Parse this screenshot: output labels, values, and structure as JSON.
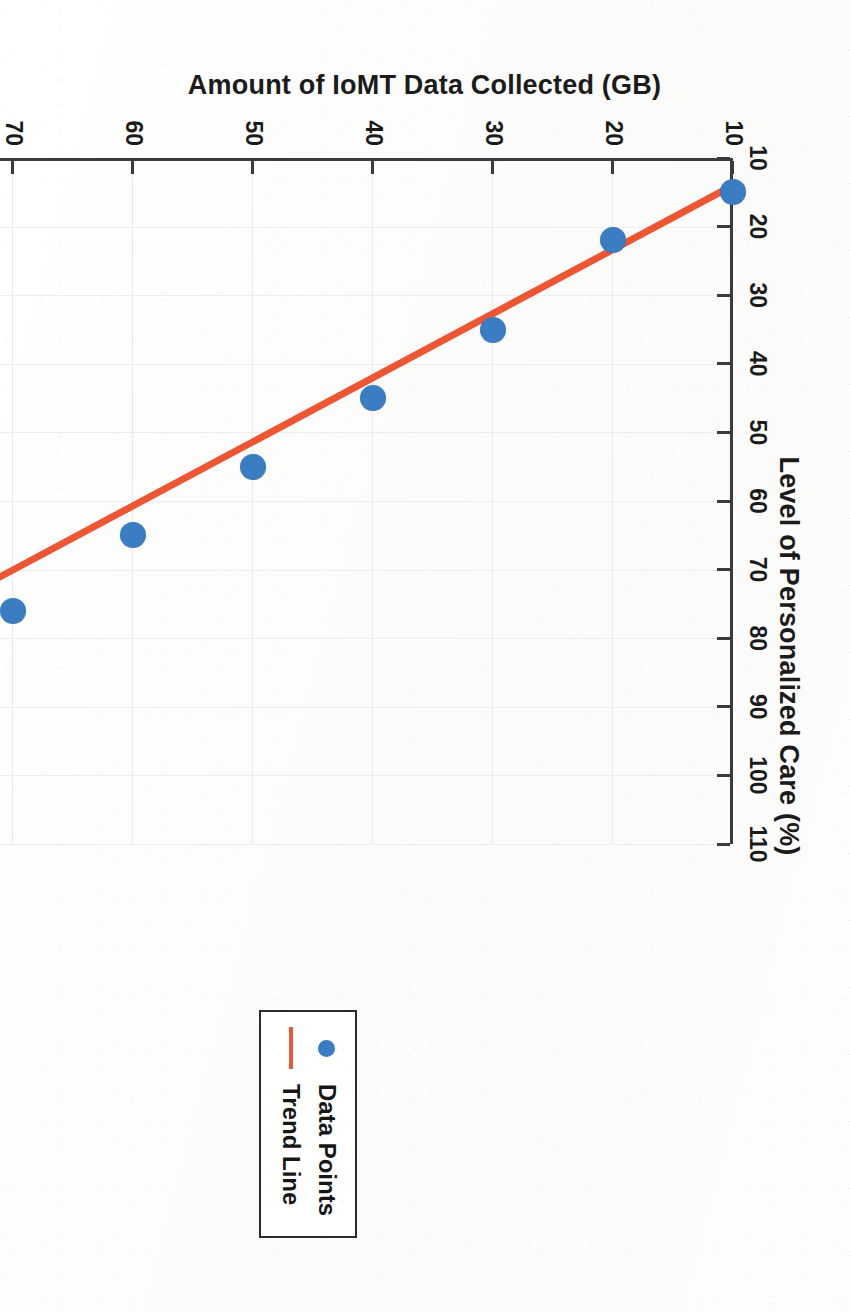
{
  "figure": {
    "orientation_note": "rotated-90-cw",
    "colors": {
      "marker": "#3a7dc2",
      "trend_line": "#ee5533",
      "axis": "#3b3b3b",
      "grid": "#e9e9ec",
      "legend_border": "#2c2c2c",
      "page_background": "#fdfdfd"
    }
  },
  "legend": {
    "position": "bottom-right-inside",
    "items": [
      {
        "label": "Data Points",
        "marker": "dot",
        "color": "#3a7dc2"
      },
      {
        "label": "Trend Line",
        "marker": "line",
        "color": "#ee5533"
      }
    ]
  },
  "chart_data": {
    "type": "scatter",
    "title": "",
    "xlabel": "Level of Personalized Care (%)",
    "ylabel": "Amount of IoMT Data Collected (GB)",
    "xlim": [
      10,
      110
    ],
    "ylim": [
      10,
      100
    ],
    "xticks": [
      10,
      20,
      30,
      40,
      50,
      60,
      70,
      80,
      90,
      100,
      110
    ],
    "yticks": [
      10,
      20,
      30,
      40,
      50,
      60,
      70,
      80,
      90,
      100
    ],
    "xtick_labels": [
      "10",
      "20",
      "30",
      "40",
      "50",
      "60",
      "70",
      "80",
      "90",
      "100",
      "110"
    ],
    "ytick_labels": [
      "10",
      "20",
      "30",
      "40",
      "50",
      "60",
      "70",
      "80",
      "90",
      "100"
    ],
    "grid": true,
    "legend_position": "lower right",
    "series": [
      {
        "name": "Data Points",
        "type": "scatter",
        "color": "#3a7dc2",
        "x": [
          15,
          22,
          35,
          45,
          55,
          65,
          76,
          82,
          90,
          98
        ],
        "y": [
          10,
          20,
          30,
          40,
          50,
          60,
          70,
          80,
          90,
          100
        ]
      },
      {
        "name": "Trend Line",
        "type": "line",
        "color": "#ee5533",
        "x": [
          14,
          99
        ],
        "y": [
          10,
          101
        ]
      }
    ]
  }
}
